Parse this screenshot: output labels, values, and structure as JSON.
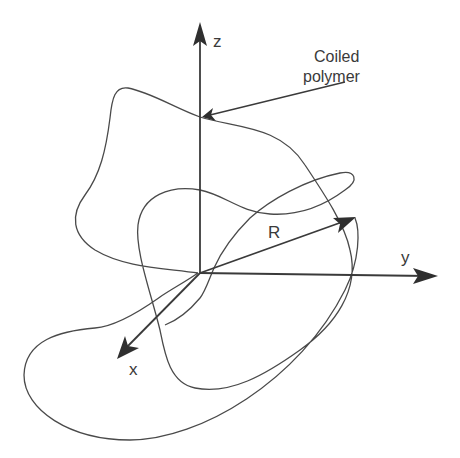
{
  "diagram": {
    "type": "3d-coordinate-system-with-polymer-coil",
    "axes": {
      "z": {
        "label": "z"
      },
      "y": {
        "label": "y"
      },
      "x": {
        "label": "x"
      }
    },
    "vector": {
      "label": "R"
    },
    "annotation": {
      "line1": "Coiled",
      "line2": "polymer"
    },
    "colors": {
      "line": "#3a3a3a",
      "text": "#3a3a3a",
      "background": "#ffffff"
    }
  }
}
